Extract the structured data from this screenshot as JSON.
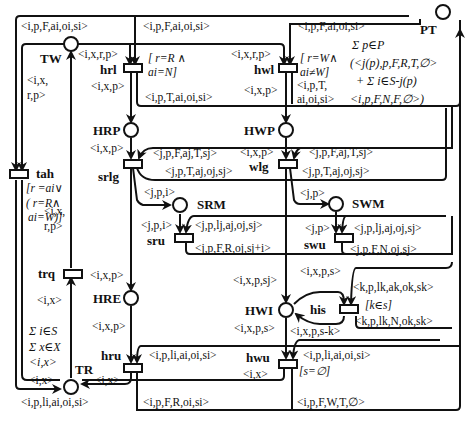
{
  "places": {
    "TW": "TW",
    "PT": "PT",
    "HRP": "HRP",
    "HWP": "HWP",
    "SRM": "SRM",
    "SWM": "SWM",
    "HRE": "HRE",
    "HWI": "HWI",
    "TR": "TR"
  },
  "transitions": {
    "hrl": "hrl",
    "hwl": "hwl",
    "tah": "tah",
    "srlg": "srlg",
    "wlg": "wlg",
    "sru": "sru",
    "swu": "swu",
    "trq": "trq",
    "his": "his",
    "hru": "hru",
    "hwu": "hwu"
  },
  "arc_labels": {
    "top_left_ipFaioisi": "<i,p,F,ai,oi,si>",
    "top_mid_ipFaioisi": "<i,p,F,ai,oi,si>",
    "top_right_ipFaioisi": "<i,p,F,ai,oi,si>",
    "tw_hrl_ixrp": "<i,x,r,p>",
    "tw_hwl_ixrp": "<i,x,r,p>",
    "tw_tah_ix": "<i,x,",
    "tw_tah_rp": "r,p>",
    "hrl_out_ixp": "<i,x,p>",
    "hrl_pt_ipTaioisi": "<i,p,T,ai,oi,si>",
    "hwl_out_ixp": "<i,x,p>",
    "hwl_pt_ipT": "<i,p,T,",
    "hwl_pt_aioisi": "ai,oi,si>",
    "hrp_srlg_ixp": "<i,x,p>",
    "srlg_in_jpFajTsj": "<j,p,F,aj,T,sj>",
    "srlg_out_jpTajojsj": "<j,p,T,aj,oj,sj>",
    "srlg_srm_jpi": "<j,p,i>",
    "hwp_wlg_ixp": "<i,x,p>",
    "wlg_in_jpFajTsj": "<j,p,F,aj,T,sj>",
    "wlg_out_jpTajojsj": "<j,p,T,aj,oj,sj>",
    "wlg_swm_jp": "<j,p>",
    "srm_sru_jpi": "<j,p,i>",
    "sru_in_jpljajojsj": "<j,p,lj,aj,oj,sj>",
    "sru_out_jpFRojsji": "<j,p,F,R,oj,sj+i>",
    "swm_swu_jp": "<j,p>",
    "swu_in_jpljajojsj": "<j,p,lj,aj,oj,sj>",
    "swu_out_jpFNojsj": "<j,p,F,N,oj,sj>",
    "trq_tw_ix": "<i,x,",
    "trq_tw_rp": "r,p>",
    "tr_trq_ix": "<i,x>",
    "srlg_hre_ixp": "<i,x,p>",
    "hre_hru_ixp": "<i,x,p>",
    "wlg_hwi_ixpsj": "<i,x,p,sj>",
    "hwi_his_ixps": "<i,x,p,s>",
    "his_hwi_ixpsk": "<i,x,p,s-k>",
    "his_in_kplkakoksk": "<k,p,lk,ak,ok,sk>",
    "his_out_kplkNoksk": "<k,p,lk,N,ok,sk>",
    "hwi_hwu_ixps": "<i,x,p,s>",
    "hru_in_iplaioisi": "<i,p,li,ai,oi,si>",
    "hwu_in_iplaioisi": "<i,p,li,ai,oi,si>",
    "tr_left_ix": "<i,x>",
    "hru_tr_ix": "<i,x>",
    "hwu_tr_ix": "<i,x>",
    "tah_tr_ix": "<i,x>",
    "bottom_iplaioisi": "<i,p,li,ai,oi,si>",
    "bottom_ipFRoisi": "<i,p,F,R,oi,si>",
    "bottom_ipFWTempty": "<i,p,F,W,T,∅>"
  },
  "guards": {
    "hrl_1": "[ r=R ∧",
    "hrl_2": "ai=N]",
    "hwl_1": "[ r=W∧",
    "hwl_2": "ai≠W]",
    "tah_1": "[r =ai∨",
    "tah_2": "( r=R∧",
    "tah_3": "ai=W)]",
    "his": "[k∈s]",
    "hwu": "[s=∅]"
  },
  "initial_markings": {
    "PT_1": "Σ p∈P",
    "PT_2": "(<j(p),p,F,R,T,∅>",
    "PT_3": "+ Σ i∈S-j(p)",
    "PT_4": "<i,p,F,N,F,∅>)",
    "TR_1": "Σ i∈S",
    "TR_2": "Σ x∈X",
    "TR_3": "<i,x>"
  }
}
